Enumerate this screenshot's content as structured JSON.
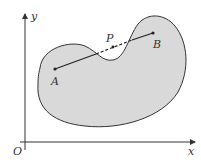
{
  "diagram": {
    "axes": {
      "x_label": "x",
      "y_label": "y",
      "origin_label": "O"
    },
    "points": [
      {
        "label": "A",
        "x": 55,
        "y": 69
      },
      {
        "label": "B",
        "x": 153,
        "y": 33
      },
      {
        "label": "P",
        "x": 113,
        "y": 47
      }
    ],
    "colors": {
      "region_fill": "#d9d9d9",
      "stroke": "#333333"
    }
  }
}
